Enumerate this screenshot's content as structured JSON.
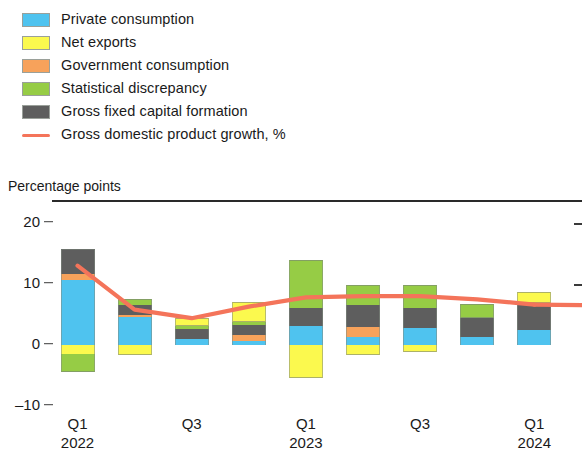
{
  "legend": {
    "items": [
      {
        "label": "Private consumption",
        "color": "#4fc3ef",
        "type": "swatch"
      },
      {
        "label": "Net exports",
        "color": "#fbf94e",
        "type": "swatch"
      },
      {
        "label": "Government consumption",
        "color": "#f7a25b",
        "type": "swatch"
      },
      {
        "label": "Statistical discrepancy",
        "color": "#96cc45",
        "type": "swatch"
      },
      {
        "label": "Gross fixed capital formation",
        "color": "#5e5e5e",
        "type": "swatch"
      },
      {
        "label": "Gross domestic product growth, %",
        "color": "#f4745a",
        "type": "line"
      }
    ]
  },
  "axis_title": "Percentage points",
  "y_ticks": [
    {
      "label": "20",
      "value": 20
    },
    {
      "label": "10",
      "value": 10
    },
    {
      "label": "0",
      "value": 0
    },
    {
      "label": "–10",
      "value": -10
    }
  ],
  "x_labels": [
    {
      "quarter": "Q1",
      "year": "2022",
      "index": 0
    },
    {
      "quarter": "Q3",
      "year": "",
      "index": 2
    },
    {
      "quarter": "Q1",
      "year": "2023",
      "index": 4
    },
    {
      "quarter": "Q3",
      "year": "",
      "index": 6
    },
    {
      "quarter": "Q1",
      "year": "2024",
      "index": 8
    }
  ],
  "chart_data": {
    "type": "bar",
    "title": "",
    "subtitle": "",
    "xlabel": "",
    "ylabel": "Percentage points",
    "ylim": [
      -13,
      22
    ],
    "yticks": [
      20,
      10,
      0,
      -10
    ],
    "grid": false,
    "legend_position": "top-left",
    "stacked": true,
    "categories": [
      "Q1 2022",
      "Q2 2022",
      "Q3 2022",
      "Q4 2022",
      "Q1 2023",
      "Q2 2023",
      "Q3 2023",
      "Q4 2023",
      "Q1 2024"
    ],
    "series": [
      {
        "name": "Private consumption",
        "color": "#4fc3ef",
        "values": [
          10.6,
          4.6,
          1.0,
          0.7,
          3.1,
          1.3,
          2.8,
          1.3,
          2.5
        ]
      },
      {
        "name": "Government consumption",
        "color": "#f7a25b",
        "values": [
          1.0,
          0.3,
          0.0,
          1.0,
          0.0,
          1.6,
          0.0,
          0.0,
          0.0
        ]
      },
      {
        "name": "Gross fixed capital formation",
        "color": "#5e5e5e",
        "values": [
          4.1,
          1.6,
          1.6,
          1.5,
          3.0,
          3.6,
          3.3,
          3.1,
          4.4
        ]
      },
      {
        "name": "Statistical discrepancy",
        "color": "#96cc45",
        "values": [
          0.0,
          1.1,
          0.5,
          0.5,
          7.9,
          3.3,
          3.8,
          2.3,
          0.0
        ]
      },
      {
        "name": "Net exports",
        "color": "#fbf94e",
        "values": [
          -1.5,
          -1.6,
          1.3,
          3.3,
          -5.4,
          -1.6,
          -1.1,
          0.0,
          1.8
        ]
      },
      {
        "name": "Statistical discrepancy (negative)",
        "color": "#96cc45",
        "values": [
          -2.9,
          0.0,
          0.0,
          0.0,
          0.0,
          0.0,
          0.0,
          0.0,
          0.0
        ]
      }
    ],
    "line_series": {
      "name": "Gross domestic product growth, %",
      "color": "#f4745a",
      "values": [
        13.0,
        5.8,
        4.4,
        6.3,
        7.8,
        8.0,
        8.0,
        7.5,
        6.6
      ]
    }
  }
}
